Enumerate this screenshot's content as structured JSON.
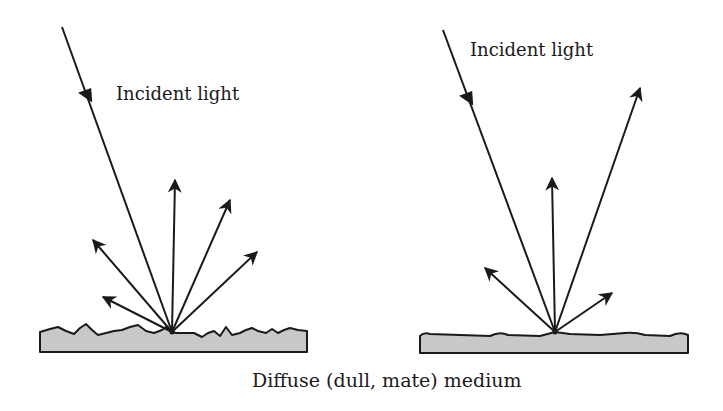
{
  "diagram": {
    "left_panel": {
      "title": "Incident light",
      "surface": "rough",
      "incident_ray": {
        "from": [
          62,
          27
        ],
        "to": [
          172,
          332
        ]
      },
      "reflected_rays": [
        {
          "to": [
            103,
            297
          ]
        },
        {
          "to": [
            93,
            240
          ]
        },
        {
          "to": [
            175,
            180
          ]
        },
        {
          "to": [
            230,
            200
          ]
        },
        {
          "to": [
            257,
            252
          ]
        }
      ]
    },
    "right_panel": {
      "title": "Incident light",
      "surface": "smoother",
      "incident_ray": {
        "from": [
          443,
          30
        ],
        "to": [
          555,
          332
        ]
      },
      "reflected_rays": [
        {
          "to": [
            485,
            268
          ]
        },
        {
          "to": [
            552,
            178
          ]
        },
        {
          "to": [
            640,
            88
          ]
        },
        {
          "to": [
            612,
            293
          ]
        }
      ]
    },
    "caption": "Diffuse (dull, mate) medium",
    "colors": {
      "line": "#1a1a1a",
      "medium_fill": "#c8c8c8",
      "background": "#ffffff"
    }
  }
}
